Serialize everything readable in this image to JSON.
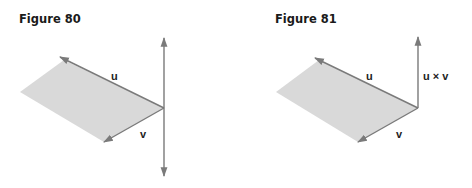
{
  "figures": [
    {
      "title": "Figure 80",
      "labels": {
        "u": "u",
        "v": "v"
      }
    },
    {
      "title": "Figure 81",
      "labels": {
        "u": "u",
        "v": "v",
        "cross": "u × v"
      }
    }
  ],
  "colors": {
    "plane_fill": "#d9d9d9",
    "vector_stroke": "#7a7a7a",
    "text": "#1a1a1a"
  }
}
